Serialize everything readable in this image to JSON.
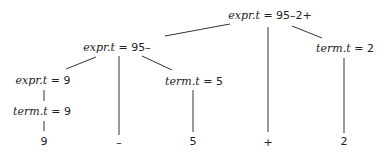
{
  "tree": {
    "nodes": [
      {
        "id": "root",
        "attr": "expr.t",
        "eq": " = ",
        "value": "95–2+"
      },
      {
        "id": "expr95",
        "attr": "expr.t",
        "eq": " = ",
        "value": "95–"
      },
      {
        "id": "term2",
        "attr": "term.t",
        "eq": " = ",
        "value": "2"
      },
      {
        "id": "expr9",
        "attr": "expr.t",
        "eq": " = ",
        "value": "9"
      },
      {
        "id": "term5",
        "attr": "term.t",
        "eq": " = ",
        "value": "5"
      },
      {
        "id": "term9",
        "attr": "term.t",
        "eq": " = ",
        "value": "9"
      }
    ],
    "leaves": [
      "9",
      "–",
      "5",
      "+",
      "2"
    ]
  }
}
